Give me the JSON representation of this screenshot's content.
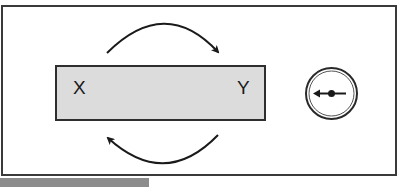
{
  "diagram": {
    "box": {
      "left_label": "X",
      "right_label": "Y",
      "fill_color": "#dcdcdc",
      "border_color": "#2e2e2e"
    },
    "arrows": [
      {
        "name": "top-arc",
        "direction": "left-to-right",
        "position": "above box"
      },
      {
        "name": "bottom-arc",
        "direction": "right-to-left",
        "position": "below box"
      }
    ],
    "dial": {
      "icon": "gauge-pointer-left-icon",
      "pointer_direction": "left"
    },
    "frame_border_color": "#3a3a3a"
  },
  "bottom": {
    "caption_band_color": "#8c8c8c",
    "caption_text": ""
  }
}
